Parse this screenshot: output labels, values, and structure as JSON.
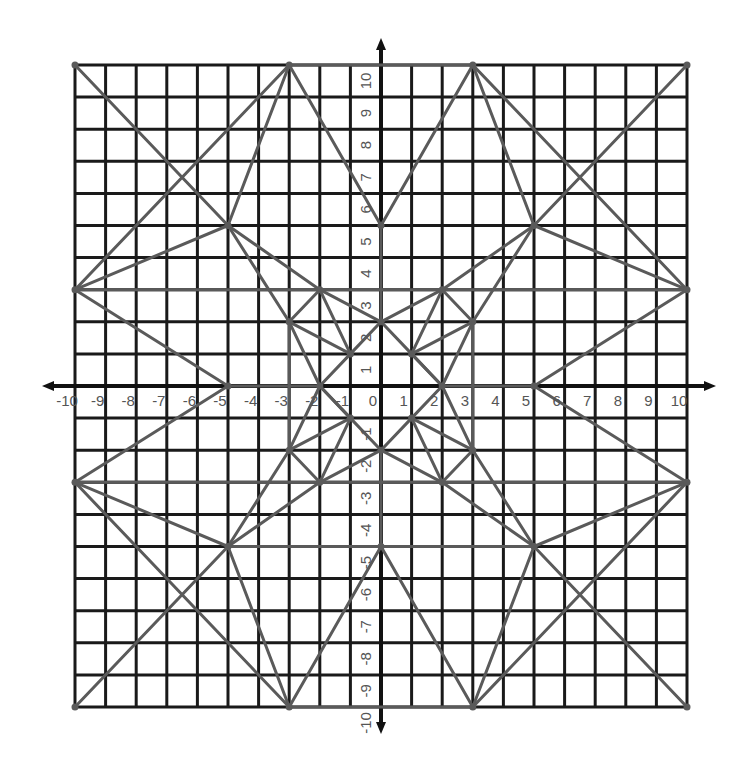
{
  "diagram": {
    "title": "",
    "x_range": [
      -10,
      10
    ],
    "y_range": [
      -10,
      10
    ],
    "grid_step": 1,
    "x_tick_labels": [
      "-10",
      "-9",
      "-8",
      "-7",
      "-6",
      "-5",
      "-4",
      "-3",
      "-2",
      "-1",
      "0",
      "1",
      "2",
      "3",
      "4",
      "5",
      "6",
      "7",
      "8",
      "9",
      "10"
    ],
    "y_tick_labels": [
      "-10",
      "-9",
      "-8",
      "-7",
      "-6",
      "-5",
      "-4",
      "-3",
      "-2",
      "-1",
      "1",
      "2",
      "3",
      "4",
      "5",
      "6",
      "7",
      "8",
      "9",
      "10"
    ],
    "colors": {
      "grid": "#1a1a1a",
      "axis": "#111111",
      "segment": "#5a5a5a",
      "label": "#555555",
      "background": "#ffffff"
    },
    "vertices": [
      [
        -10,
        10
      ],
      [
        10,
        10
      ],
      [
        -10,
        -10
      ],
      [
        10,
        -10
      ],
      [
        -3,
        10
      ],
      [
        3,
        10
      ],
      [
        -3,
        -10
      ],
      [
        3,
        -10
      ],
      [
        -10,
        3
      ],
      [
        10,
        3
      ],
      [
        -10,
        -3
      ],
      [
        10,
        -3
      ],
      [
        -5,
        5
      ],
      [
        5,
        5
      ],
      [
        -5,
        -5
      ],
      [
        5,
        -5
      ],
      [
        0,
        5
      ],
      [
        0,
        -5
      ],
      [
        -5,
        0
      ],
      [
        5,
        0
      ],
      [
        0,
        2
      ],
      [
        0,
        -2
      ],
      [
        -2,
        0
      ],
      [
        2,
        0
      ],
      [
        -1,
        1
      ],
      [
        1,
        1
      ],
      [
        -1,
        -1
      ],
      [
        1,
        -1
      ],
      [
        -2,
        3
      ],
      [
        2,
        3
      ],
      [
        -2,
        -3
      ],
      [
        2,
        -3
      ],
      [
        -3,
        2
      ],
      [
        3,
        2
      ],
      [
        -3,
        -2
      ],
      [
        3,
        -2
      ]
    ],
    "segments": [
      [
        [
          -10,
          10
        ],
        [
          -5,
          5
        ]
      ],
      [
        [
          10,
          10
        ],
        [
          5,
          5
        ]
      ],
      [
        [
          -10,
          -10
        ],
        [
          -5,
          -5
        ]
      ],
      [
        [
          10,
          -10
        ],
        [
          5,
          -5
        ]
      ],
      [
        [
          -3,
          10
        ],
        [
          3,
          10
        ]
      ],
      [
        [
          -3,
          -10
        ],
        [
          3,
          -10
        ]
      ],
      [
        [
          -10,
          3
        ],
        [
          10,
          3
        ]
      ],
      [
        [
          -10,
          -3
        ],
        [
          10,
          -3
        ]
      ],
      [
        [
          -5,
          -5
        ],
        [
          5,
          -5
        ]
      ],
      [
        [
          -3,
          10
        ],
        [
          -5,
          5
        ]
      ],
      [
        [
          -3,
          10
        ],
        [
          0,
          5
        ]
      ],
      [
        [
          3,
          10
        ],
        [
          0,
          5
        ]
      ],
      [
        [
          3,
          10
        ],
        [
          5,
          5
        ]
      ],
      [
        [
          -3,
          -10
        ],
        [
          -5,
          -5
        ]
      ],
      [
        [
          -3,
          -10
        ],
        [
          0,
          -5
        ]
      ],
      [
        [
          3,
          -10
        ],
        [
          0,
          -5
        ]
      ],
      [
        [
          3,
          -10
        ],
        [
          5,
          -5
        ]
      ],
      [
        [
          -3,
          10
        ],
        [
          -10,
          3
        ]
      ],
      [
        [
          3,
          10
        ],
        [
          10,
          3
        ]
      ],
      [
        [
          -3,
          -10
        ],
        [
          -10,
          -3
        ]
      ],
      [
        [
          3,
          -10
        ],
        [
          10,
          -3
        ]
      ],
      [
        [
          -10,
          3
        ],
        [
          -5,
          5
        ]
      ],
      [
        [
          -10,
          3
        ],
        [
          -5,
          0
        ]
      ],
      [
        [
          10,
          3
        ],
        [
          5,
          5
        ]
      ],
      [
        [
          10,
          3
        ],
        [
          5,
          0
        ]
      ],
      [
        [
          -10,
          -3
        ],
        [
          -5,
          -5
        ]
      ],
      [
        [
          -10,
          -3
        ],
        [
          -5,
          0
        ]
      ],
      [
        [
          10,
          -3
        ],
        [
          5,
          -5
        ]
      ],
      [
        [
          10,
          -3
        ],
        [
          5,
          0
        ]
      ],
      [
        [
          -5,
          5
        ],
        [
          -2,
          3
        ]
      ],
      [
        [
          -2,
          3
        ],
        [
          0,
          2
        ]
      ],
      [
        [
          5,
          5
        ],
        [
          2,
          3
        ]
      ],
      [
        [
          2,
          3
        ],
        [
          0,
          2
        ]
      ],
      [
        [
          -5,
          -5
        ],
        [
          -2,
          -3
        ]
      ],
      [
        [
          -2,
          -3
        ],
        [
          0,
          -2
        ]
      ],
      [
        [
          5,
          -5
        ],
        [
          2,
          -3
        ]
      ],
      [
        [
          2,
          -3
        ],
        [
          0,
          -2
        ]
      ],
      [
        [
          -5,
          5
        ],
        [
          -3,
          2
        ]
      ],
      [
        [
          -3,
          2
        ],
        [
          -2,
          0
        ]
      ],
      [
        [
          5,
          5
        ],
        [
          3,
          2
        ]
      ],
      [
        [
          3,
          2
        ],
        [
          2,
          0
        ]
      ],
      [
        [
          -5,
          -5
        ],
        [
          -3,
          -2
        ]
      ],
      [
        [
          -3,
          -2
        ],
        [
          -2,
          0
        ]
      ],
      [
        [
          5,
          -5
        ],
        [
          3,
          -2
        ]
      ],
      [
        [
          3,
          -2
        ],
        [
          2,
          0
        ]
      ],
      [
        [
          0,
          5
        ],
        [
          0,
          2
        ]
      ],
      [
        [
          0,
          -5
        ],
        [
          0,
          -2
        ]
      ],
      [
        [
          -5,
          0
        ],
        [
          -2,
          0
        ]
      ],
      [
        [
          5,
          0
        ],
        [
          2,
          0
        ]
      ],
      [
        [
          0,
          2
        ],
        [
          -1,
          1
        ]
      ],
      [
        [
          -1,
          1
        ],
        [
          -2,
          0
        ]
      ],
      [
        [
          0,
          2
        ],
        [
          1,
          1
        ]
      ],
      [
        [
          1,
          1
        ],
        [
          2,
          0
        ]
      ],
      [
        [
          0,
          -2
        ],
        [
          -1,
          -1
        ]
      ],
      [
        [
          -1,
          -1
        ],
        [
          -2,
          0
        ]
      ],
      [
        [
          0,
          -2
        ],
        [
          1,
          -1
        ]
      ],
      [
        [
          1,
          -1
        ],
        [
          2,
          0
        ]
      ],
      [
        [
          -1,
          1
        ],
        [
          -2,
          3
        ]
      ],
      [
        [
          -1,
          1
        ],
        [
          -3,
          2
        ]
      ],
      [
        [
          -2,
          3
        ],
        [
          -3,
          2
        ]
      ],
      [
        [
          1,
          1
        ],
        [
          2,
          3
        ]
      ],
      [
        [
          1,
          1
        ],
        [
          3,
          2
        ]
      ],
      [
        [
          2,
          3
        ],
        [
          3,
          2
        ]
      ],
      [
        [
          -1,
          -1
        ],
        [
          -2,
          -3
        ]
      ],
      [
        [
          -1,
          -1
        ],
        [
          -3,
          -2
        ]
      ],
      [
        [
          -2,
          -3
        ],
        [
          -3,
          -2
        ]
      ],
      [
        [
          1,
          -1
        ],
        [
          2,
          -3
        ]
      ],
      [
        [
          1,
          -1
        ],
        [
          3,
          -2
        ]
      ],
      [
        [
          2,
          -3
        ],
        [
          3,
          -2
        ]
      ],
      [
        [
          -3,
          2
        ],
        [
          -3,
          -2
        ]
      ],
      [
        [
          3,
          2
        ],
        [
          3,
          -2
        ]
      ],
      [
        [
          -2,
          0
        ],
        [
          -1,
          -1
        ]
      ],
      [
        [
          2,
          0
        ],
        [
          1,
          1
        ]
      ]
    ]
  }
}
